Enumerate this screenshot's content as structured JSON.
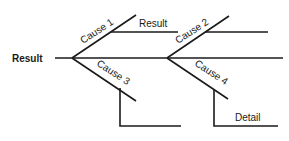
{
  "diagram": {
    "type": "fishbone",
    "effect_label": "Result",
    "branches": [
      {
        "id": "cause1",
        "label": "Cause 1",
        "direction": "up",
        "sub_label": "Result"
      },
      {
        "id": "cause2",
        "label": "Cause 2",
        "direction": "up",
        "sub_label": ""
      },
      {
        "id": "cause3",
        "label": "Cause 3",
        "direction": "down",
        "sub_label": ""
      },
      {
        "id": "cause4",
        "label": "Cause 4",
        "direction": "down",
        "sub_label": "Detail"
      }
    ]
  },
  "colors": {
    "line": "#1a1a1a",
    "background": "#ffffff"
  }
}
